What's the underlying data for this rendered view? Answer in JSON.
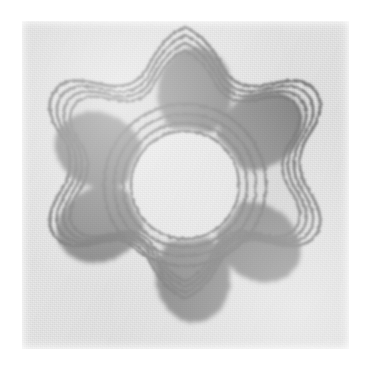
{
  "figure": {
    "kind": "scanned-contour-map",
    "media": "halftone print on aged paper",
    "colors": {
      "page_background": "#ffffff",
      "paper": "#e9e9e9",
      "paper_light_core": "#ececec",
      "lobe_fill": "#8d8d8d",
      "mid_tint": "#dedede",
      "contour_line": "#7c7c7c"
    },
    "geometry": {
      "paper_rect": {
        "x": 22,
        "y": 21,
        "width": 327,
        "height": 328
      },
      "center": {
        "x": 163,
        "y": 164
      },
      "symmetry_order": 6,
      "lobe_ring_radius": 93,
      "lobe_rx": 36,
      "lobe_ry": 44,
      "lobe_angles_deg": [
        -60,
        0,
        60,
        120,
        180,
        240
      ],
      "outer_contour_count": 4,
      "central_contour_count": 4,
      "central_void_radius": 52
    },
    "chart_data": {
      "type": "heatmap",
      "title": "",
      "xlabel": "",
      "ylabel": "",
      "grid": false,
      "legend": "none",
      "series_name": "electron density",
      "levels": [
        1,
        2,
        3,
        4,
        5,
        6
      ],
      "level_roles": [
        "outermost star contour",
        "second star contour",
        "third star contour",
        "inner star contour / lobe boundary",
        "central ring contours",
        "central void boundary"
      ],
      "maxima": [
        {
          "label": "lobe-1",
          "angle_deg": -60,
          "radius": 93,
          "intensity": 6
        },
        {
          "label": "lobe-2",
          "angle_deg": 0,
          "radius": 93,
          "intensity": 6
        },
        {
          "label": "lobe-3",
          "angle_deg": 60,
          "radius": 93,
          "intensity": 6
        },
        {
          "label": "lobe-4",
          "angle_deg": 120,
          "radius": 93,
          "intensity": 6
        },
        {
          "label": "lobe-5",
          "angle_deg": 180,
          "radius": 93,
          "intensity": 6
        },
        {
          "label": "lobe-6",
          "angle_deg": 240,
          "radius": 93,
          "intensity": 6
        }
      ],
      "minimum": {
        "label": "central void",
        "angle_deg": 0,
        "radius": 0,
        "intensity": 1
      }
    }
  }
}
